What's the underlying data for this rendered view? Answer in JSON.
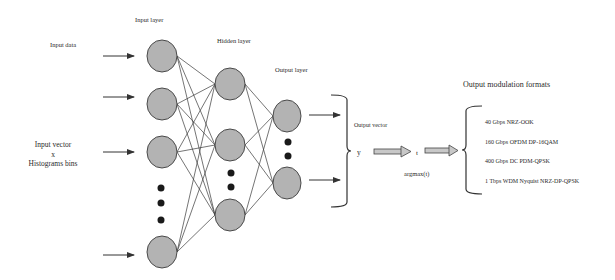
{
  "labels": {
    "input_data": "Input data",
    "input_layer": "Input layer",
    "hidden_layer": "Hidden layer",
    "output_layer": "Output layer",
    "input_vector_line1": "Input vector",
    "input_vector_line2": "x",
    "input_vector_line3": "Histograms bins",
    "output_vector": "Output vector",
    "y": "y",
    "t": "t",
    "argmax": "argmax(t)",
    "output_formats_title": "Output modulation formats"
  },
  "output_formats": [
    "40 Gbps NRZ-OOK",
    "160 Gbps OFDM DP-16QAM",
    "400 Gbps DC PDM-QPSK",
    "1 Tbps WDM Nyquist NRZ-DP-QPSK"
  ],
  "colors": {
    "node_fill": "#b3b3b3",
    "node_stroke": "#4a4a4a",
    "edge": "#3a3a3a",
    "dot": "#1a1a1a",
    "text": "#2a2a2a"
  }
}
